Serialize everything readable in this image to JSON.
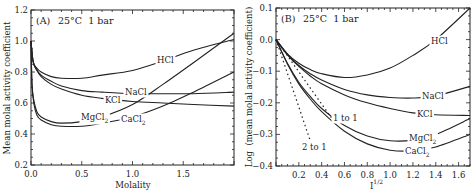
{
  "chart_data": [
    {
      "type": "line",
      "panel": "(A)",
      "title": "25°C 1 bar",
      "xlabel": "Molality",
      "ylabel": "Mean molal activity coefficient",
      "xlim": [
        0,
        2.0
      ],
      "ylim": [
        0.2,
        1.2
      ],
      "xticks": [
        "0.0",
        "0.5",
        "1.0",
        "1.5"
      ],
      "yticks": [
        "0.2",
        "0.4",
        "0.6",
        "0.8",
        "1.0",
        "1.2"
      ],
      "grid": false,
      "series": [
        {
          "name": "HCl",
          "x": [
            0,
            0.02,
            0.05,
            0.1,
            0.2,
            0.3,
            0.5,
            0.7,
            1.0,
            1.3,
            1.6,
            2.0
          ],
          "values": [
            1.0,
            0.87,
            0.83,
            0.8,
            0.77,
            0.76,
            0.76,
            0.78,
            0.81,
            0.87,
            0.94,
            1.01
          ]
        },
        {
          "name": "NaCl",
          "x": [
            0,
            0.02,
            0.05,
            0.1,
            0.2,
            0.3,
            0.5,
            0.7,
            1.0,
            1.3,
            1.6,
            2.0
          ],
          "values": [
            1.0,
            0.87,
            0.82,
            0.78,
            0.74,
            0.71,
            0.68,
            0.67,
            0.66,
            0.66,
            0.66,
            0.67
          ]
        },
        {
          "name": "KCl",
          "x": [
            0,
            0.02,
            0.05,
            0.1,
            0.2,
            0.3,
            0.5,
            0.7,
            1.0,
            1.3,
            1.6,
            2.0
          ],
          "values": [
            1.0,
            0.87,
            0.82,
            0.77,
            0.72,
            0.69,
            0.65,
            0.63,
            0.61,
            0.6,
            0.59,
            0.58
          ]
        },
        {
          "name": "MgCl2",
          "x": [
            0,
            0.01,
            0.03,
            0.06,
            0.1,
            0.2,
            0.3,
            0.5,
            0.7,
            1.0,
            1.3,
            1.6,
            2.0
          ],
          "values": [
            1.0,
            0.72,
            0.61,
            0.54,
            0.51,
            0.48,
            0.47,
            0.48,
            0.51,
            0.59,
            0.72,
            0.86,
            1.05
          ]
        },
        {
          "name": "CaCl2",
          "x": [
            0,
            0.01,
            0.03,
            0.06,
            0.1,
            0.2,
            0.3,
            0.5,
            0.7,
            1.0,
            1.3,
            1.6,
            2.0
          ],
          "values": [
            1.0,
            0.71,
            0.59,
            0.52,
            0.49,
            0.46,
            0.45,
            0.45,
            0.47,
            0.51,
            0.58,
            0.67,
            0.8
          ]
        }
      ],
      "annotations": [
        "HCl",
        "NaCl",
        "KCl",
        "MgCl2",
        "CaCl2"
      ]
    },
    {
      "type": "line",
      "panel": "(B)",
      "title": "25°C 1 bar",
      "xlabel": "I^1/2",
      "ylabel": "Log (mean molal activity coefficient)",
      "xlim": [
        0,
        1.7
      ],
      "ylim": [
        -0.4,
        0.1
      ],
      "xticks": [
        "0.2",
        "0.4",
        "0.6",
        "0.8",
        "1.0",
        "1.2",
        "1.4",
        "1.6"
      ],
      "yticks": [
        "0.1",
        "0.0",
        "-0.1",
        "-0.2",
        "-0.3",
        "-0.4"
      ],
      "grid": false,
      "series": [
        {
          "name": "HCl",
          "x": [
            0,
            0.1,
            0.2,
            0.3,
            0.4,
            0.6,
            0.8,
            1.0,
            1.2,
            1.4,
            1.7
          ],
          "values": [
            0,
            -0.045,
            -0.075,
            -0.095,
            -0.108,
            -0.12,
            -0.112,
            -0.09,
            -0.05,
            0.0,
            0.1
          ]
        },
        {
          "name": "NaCl",
          "x": [
            0,
            0.1,
            0.2,
            0.3,
            0.4,
            0.6,
            0.8,
            1.0,
            1.2,
            1.4,
            1.7
          ],
          "values": [
            0,
            -0.047,
            -0.082,
            -0.108,
            -0.128,
            -0.158,
            -0.175,
            -0.183,
            -0.185,
            -0.178,
            -0.148
          ]
        },
        {
          "name": "KCl",
          "x": [
            0,
            0.1,
            0.2,
            0.3,
            0.4,
            0.6,
            0.8,
            1.0,
            1.2,
            1.4,
            1.7
          ],
          "values": [
            0,
            -0.048,
            -0.085,
            -0.115,
            -0.14,
            -0.175,
            -0.2,
            -0.218,
            -0.232,
            -0.238,
            -0.24
          ]
        },
        {
          "name": "MgCl2",
          "x": [
            0,
            0.1,
            0.2,
            0.3,
            0.4,
            0.6,
            0.8,
            1.0,
            1.2,
            1.4,
            1.7
          ],
          "values": [
            0,
            -0.075,
            -0.135,
            -0.18,
            -0.218,
            -0.272,
            -0.305,
            -0.32,
            -0.318,
            -0.3,
            -0.25
          ]
        },
        {
          "name": "CaCl2",
          "x": [
            0,
            0.1,
            0.2,
            0.3,
            0.4,
            0.6,
            0.8,
            1.0,
            1.2,
            1.4,
            1.7
          ],
          "values": [
            0,
            -0.077,
            -0.14,
            -0.188,
            -0.228,
            -0.29,
            -0.33,
            -0.35,
            -0.352,
            -0.34,
            -0.3
          ]
        },
        {
          "name": "1 to 1",
          "style": "dotted",
          "x": [
            0,
            0.5
          ],
          "values": [
            0,
            -0.255
          ]
        },
        {
          "name": "2 to 1",
          "style": "dotted",
          "x": [
            0,
            0.3
          ],
          "values": [
            0,
            -0.32
          ]
        }
      ],
      "annotations": [
        "HCl",
        "NaCl",
        "KCl",
        "MgCl2",
        "CaCl2",
        "1 to 1",
        "2 to 1"
      ]
    }
  ],
  "panelA": {
    "tag": "(A)",
    "conditions": "25°C  1 bar",
    "xlabel": "Molality",
    "ylabel": "Mean molal activity coefficient",
    "labels": {
      "hcl": "HCl",
      "nacl": "NaCl",
      "kcl": "KCl",
      "mg": "MgCl",
      "ca": "CaCl",
      "sub2": "2"
    }
  },
  "panelB": {
    "tag": "(B)",
    "conditions": "25°C  1 bar",
    "xlabel_base": "I",
    "xlabel_sup": "1/2",
    "ylabel": "Log  (mean molal activity coefficient)",
    "labels": {
      "hcl": "HCl",
      "nacl": "NaCl",
      "kcl": "KCl",
      "mg": "MgCl",
      "ca": "CaCl",
      "sub2": "2",
      "oneone": "1 to 1",
      "twoone": "2 to 1"
    }
  }
}
